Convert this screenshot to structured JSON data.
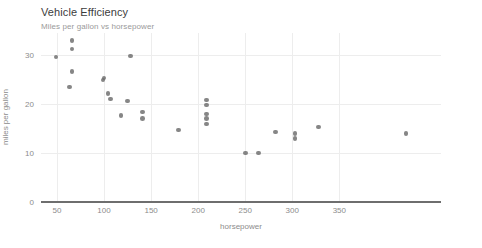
{
  "chart_data": {
    "type": "scatter",
    "title": "Vehicle Efficiency",
    "subtitle": "Miles per gallon vs horsepower",
    "xlabel": "horsepower",
    "ylabel": "miles per gallon",
    "xlim": [
      33,
      458
    ],
    "ylim": [
      0,
      34.5
    ],
    "xticks": [
      50,
      100,
      150,
      200,
      250,
      300,
      350
    ],
    "yticks": [
      0,
      10,
      20,
      30
    ],
    "xtick_labels": [
      "50",
      "100",
      "150",
      "200",
      "250",
      "300",
      "350"
    ],
    "ytick_labels": [
      "0",
      "10",
      "20",
      "30"
    ],
    "grid": true,
    "legend": null,
    "marker_color": "#6b6b6b",
    "axis_color": "#6e6e6e",
    "grid_color": "#ededed",
    "text_color": "#8c8c8c",
    "title_color": "#3c3c3c",
    "x": [
      66,
      66,
      49,
      66,
      63,
      100,
      99,
      104,
      107,
      125,
      118,
      128,
      141,
      141,
      179,
      209,
      209,
      209,
      209,
      209,
      250,
      264,
      282,
      303,
      303,
      328,
      421
    ],
    "y": [
      33.0,
      31.2,
      29.6,
      26.7,
      23.5,
      25.3,
      24.9,
      22.2,
      21.0,
      20.6,
      17.6,
      29.8,
      18.4,
      17.1,
      14.7,
      20.8,
      19.8,
      18.0,
      17.0,
      15.9,
      10.0,
      10.0,
      14.3,
      14.0,
      13.0,
      15.3,
      14.0
    ],
    "points": [
      {
        "x": 66,
        "y": 33.0
      },
      {
        "x": 66,
        "y": 31.2
      },
      {
        "x": 49,
        "y": 29.6
      },
      {
        "x": 66,
        "y": 26.7
      },
      {
        "x": 63,
        "y": 23.5
      },
      {
        "x": 100,
        "y": 25.3
      },
      {
        "x": 99,
        "y": 24.9
      },
      {
        "x": 104,
        "y": 22.2
      },
      {
        "x": 107,
        "y": 21.0
      },
      {
        "x": 125,
        "y": 20.6
      },
      {
        "x": 118,
        "y": 17.6
      },
      {
        "x": 128,
        "y": 29.8
      },
      {
        "x": 141,
        "y": 18.4
      },
      {
        "x": 141,
        "y": 17.1
      },
      {
        "x": 179,
        "y": 14.7
      },
      {
        "x": 209,
        "y": 20.8
      },
      {
        "x": 209,
        "y": 19.8
      },
      {
        "x": 209,
        "y": 18.0
      },
      {
        "x": 209,
        "y": 17.0
      },
      {
        "x": 209,
        "y": 15.9
      },
      {
        "x": 250,
        "y": 10.0
      },
      {
        "x": 264,
        "y": 10.0
      },
      {
        "x": 282,
        "y": 14.3
      },
      {
        "x": 303,
        "y": 14.0
      },
      {
        "x": 303,
        "y": 13.0
      },
      {
        "x": 328,
        "y": 15.3
      },
      {
        "x": 421,
        "y": 14.0
      }
    ]
  }
}
